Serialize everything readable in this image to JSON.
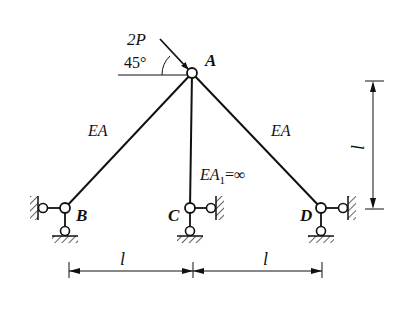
{
  "diagram": {
    "type": "truss-structure",
    "load": {
      "label": "2P",
      "angle_label": "45°",
      "direction": "inclined downward-right at 45° onto node A"
    },
    "nodes": [
      {
        "id": "A",
        "label": "A",
        "x": 192,
        "y": 73
      },
      {
        "id": "B",
        "label": "B",
        "x": 65,
        "y": 208
      },
      {
        "id": "C",
        "label": "C",
        "x": 190,
        "y": 208
      },
      {
        "id": "D",
        "label": "D",
        "x": 321,
        "y": 208
      }
    ],
    "members": [
      {
        "from": "A",
        "to": "B",
        "label": "EA"
      },
      {
        "from": "A",
        "to": "C",
        "label_main": "EA",
        "label_sub": "1",
        "label_suffix": "=∞"
      },
      {
        "from": "A",
        "to": "D",
        "label": "EA"
      }
    ],
    "dimensions": {
      "horizontal": [
        {
          "label": "l"
        },
        {
          "label": "l"
        }
      ],
      "vertical": {
        "label": "l"
      }
    }
  },
  "colors": {
    "line": "#111111",
    "background": "#ffffff"
  }
}
